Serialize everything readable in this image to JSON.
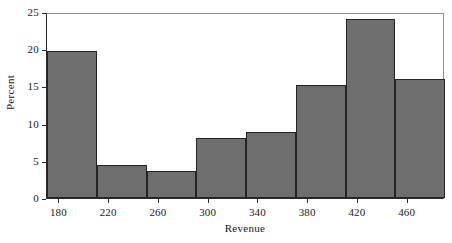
{
  "chart_data": {
    "type": "bar",
    "title": "",
    "subtitle": "",
    "xlabel": "Revenue",
    "ylabel": "Percent",
    "xlim": [
      170,
      490
    ],
    "ylim": [
      0,
      25
    ],
    "bin_width": 40,
    "bin_edges": [
      170,
      210,
      250,
      290,
      330,
      370,
      410,
      450,
      490
    ],
    "categories": [
      "170-210",
      "210-250",
      "250-290",
      "290-330",
      "330-370",
      "370-410",
      "410-450",
      "450-490"
    ],
    "values": [
      19.7,
      4.5,
      3.6,
      8.0,
      8.9,
      15.2,
      24.1,
      16.0
    ],
    "x_ticks": [
      180,
      220,
      260,
      300,
      340,
      380,
      420,
      460
    ],
    "x_tick_labels": [
      "180",
      "220",
      "260",
      "300",
      "340",
      "380",
      "420",
      "460"
    ],
    "y_ticks": [
      0,
      5,
      10,
      15,
      20,
      25
    ],
    "y_tick_labels": [
      "0",
      "5",
      "10",
      "15",
      "20",
      "25"
    ],
    "grid": false,
    "legend": false,
    "legend_position": "none",
    "bar_fill_color": "#6e6e6e",
    "bar_edge_color": "#242424",
    "axis_color": "#2b2b2b",
    "background_color": "#ffffff"
  }
}
